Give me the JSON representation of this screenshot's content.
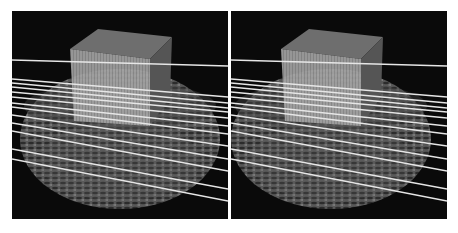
{
  "figure": {
    "panels": [
      {
        "id": "left",
        "label": "Left view",
        "offset": 0
      },
      {
        "id": "right",
        "label": "Right view",
        "offset": -24
      }
    ],
    "colors": {
      "background": "#0a0a0a",
      "cube_top": "#6e6e6e",
      "cube_front": "#a8a8a8",
      "cube_side": "#545454",
      "bowl": "#5a5a5a",
      "lines": "#e6e6e6",
      "page": "#ffffff"
    },
    "lines": [
      {
        "y1": 49,
        "y2": 55
      },
      {
        "y1": 68,
        "y2": 86
      },
      {
        "y1": 72,
        "y2": 92
      },
      {
        "y1": 76,
        "y2": 97
      },
      {
        "y1": 81,
        "y2": 101
      },
      {
        "y1": 86,
        "y2": 107
      },
      {
        "y1": 92,
        "y2": 115
      },
      {
        "y1": 96,
        "y2": 123
      },
      {
        "y1": 104,
        "y2": 135
      },
      {
        "y1": 112,
        "y2": 148
      },
      {
        "y1": 120,
        "y2": 160
      },
      {
        "y1": 138,
        "y2": 178
      },
      {
        "y1": 148,
        "y2": 190
      }
    ]
  }
}
